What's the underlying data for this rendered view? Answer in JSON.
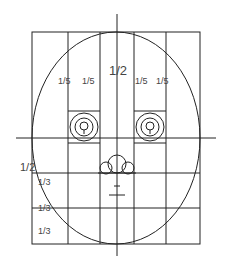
{
  "diagram": {
    "colors": {
      "line": "#222222",
      "label": "#444444",
      "background": "#ffffff"
    },
    "labels": {
      "top_half": "1/2",
      "fifth_1": "1/5",
      "fifth_2": "1/5",
      "fifth_3": "1/5",
      "fifth_4": "1/5",
      "lower_half": "1/2",
      "third_1": "1/3",
      "third_2": "1/3",
      "third_3": "1/3"
    },
    "elements": [
      "outer-grid",
      "face-ellipse",
      "center-vertical-axis",
      "eye-line",
      "left-eye",
      "right-eye",
      "nose",
      "mouth"
    ]
  }
}
